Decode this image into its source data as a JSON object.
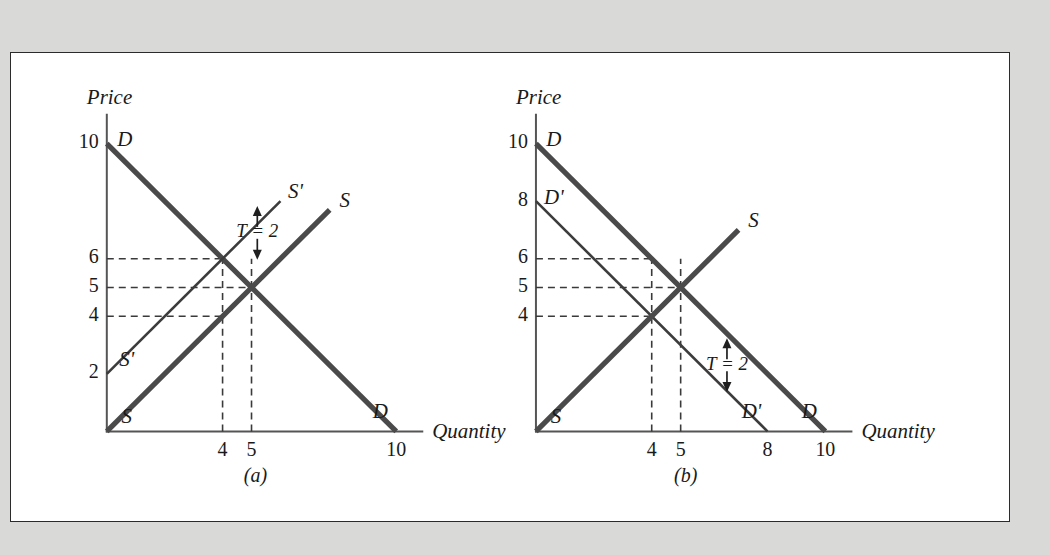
{
  "figure": {
    "background_color": "#d9d9d7",
    "panel_color": "#ffffff",
    "border_color": "#2b2b2b",
    "curve_color": "#4a4a4a",
    "thin_curve_color": "#3c3c3c"
  },
  "chart_data": [
    {
      "type": "line",
      "panel_id": "a",
      "caption": "(a)",
      "title": "",
      "xlabel": "Quantity",
      "ylabel": "Price",
      "xlim": [
        0,
        11
      ],
      "ylim": [
        0,
        11
      ],
      "grid": false,
      "xticks": [
        4,
        5,
        10
      ],
      "xtick_labels": [
        "4",
        "5",
        "10"
      ],
      "yticks": [
        2,
        4,
        5,
        6,
        10
      ],
      "ytick_labels": [
        "2",
        "4",
        "5",
        "6",
        "10"
      ],
      "series": [
        {
          "name": "D",
          "label": "D",
          "style": "thick",
          "endpoint_labels": [
            "D",
            "D"
          ],
          "points": [
            [
              0,
              10
            ],
            [
              10,
              0
            ]
          ]
        },
        {
          "name": "S",
          "label": "S",
          "style": "thick",
          "endpoint_labels": [
            "S",
            "S"
          ],
          "points": [
            [
              0,
              0
            ],
            [
              7.7,
              7.7
            ]
          ]
        },
        {
          "name": "S'",
          "label": "S'",
          "style": "thin",
          "endpoint_labels": [
            "S'",
            "S'"
          ],
          "points": [
            [
              0,
              2
            ],
            [
              6.0,
              8.0
            ]
          ]
        }
      ],
      "equilibria": [
        {
          "label": "with tax",
          "quantity": 4,
          "price": 6
        },
        {
          "label": "no tax",
          "quantity": 5,
          "price": 5
        }
      ],
      "guide_lines": [
        {
          "price": 6,
          "quantity": 4
        },
        {
          "price": 5,
          "quantity": 5
        },
        {
          "price": 4,
          "quantity": 4
        }
      ],
      "annotations": [
        {
          "text": "T = 2",
          "quantity": 5.2,
          "price": 6.9,
          "kind": "tax-gap"
        }
      ]
    },
    {
      "type": "line",
      "panel_id": "b",
      "caption": "(b)",
      "title": "",
      "xlabel": "Quantity",
      "ylabel": "Price",
      "xlim": [
        0,
        11
      ],
      "ylim": [
        0,
        11
      ],
      "grid": false,
      "xticks": [
        4,
        5,
        8,
        10
      ],
      "xtick_labels": [
        "4",
        "5",
        "8",
        "10"
      ],
      "yticks": [
        4,
        5,
        6,
        8,
        10
      ],
      "ytick_labels": [
        "4",
        "5",
        "6",
        "8",
        "10"
      ],
      "series": [
        {
          "name": "D",
          "label": "D",
          "style": "thick",
          "endpoint_labels": [
            "D",
            "D"
          ],
          "points": [
            [
              0,
              10
            ],
            [
              10,
              0
            ]
          ]
        },
        {
          "name": "D'",
          "label": "D'",
          "style": "thin",
          "endpoint_labels": [
            "D'",
            "D'"
          ],
          "points": [
            [
              0,
              8
            ],
            [
              8,
              0
            ]
          ]
        },
        {
          "name": "S",
          "label": "S",
          "style": "thick",
          "endpoint_labels": [
            "S",
            "S"
          ],
          "points": [
            [
              0,
              0
            ],
            [
              7.0,
              7.0
            ]
          ]
        }
      ],
      "equilibria": [
        {
          "label": "with tax",
          "quantity": 4,
          "price": 4
        },
        {
          "label": "no tax",
          "quantity": 5,
          "price": 5
        }
      ],
      "guide_lines": [
        {
          "price": 6,
          "quantity": 4
        },
        {
          "price": 5,
          "quantity": 5
        },
        {
          "price": 4,
          "quantity": 4
        }
      ],
      "annotations": [
        {
          "text": "T = 2",
          "quantity": 6.6,
          "price": 2.3,
          "kind": "tax-gap"
        }
      ]
    }
  ]
}
